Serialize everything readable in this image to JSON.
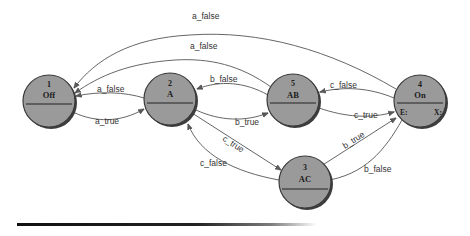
{
  "diagram": {
    "type": "state-machine",
    "nodes": [
      {
        "id": "1",
        "name": "Off",
        "cx": 49,
        "cy": 101,
        "r": 26
      },
      {
        "id": "2",
        "name": "A",
        "cx": 170,
        "cy": 99,
        "r": 26
      },
      {
        "id": "5",
        "name": "AB",
        "cx": 293,
        "cy": 100,
        "r": 26
      },
      {
        "id": "4",
        "name": "On",
        "cx": 420,
        "cy": 101,
        "r": 26,
        "entry": "E:",
        "exit": "X:"
      },
      {
        "id": "3",
        "name": "AC",
        "cx": 305,
        "cy": 182,
        "r": 26
      }
    ],
    "edges": [
      {
        "from": "On",
        "to": "Off",
        "label": "a_false"
      },
      {
        "from": "AB",
        "to": "Off",
        "label": "a_false"
      },
      {
        "from": "A",
        "to": "Off",
        "label": "a_false"
      },
      {
        "from": "Off",
        "to": "A",
        "label": "a_true"
      },
      {
        "from": "AB",
        "to": "A",
        "label": "b_false"
      },
      {
        "from": "A",
        "to": "AB",
        "label": "b_true"
      },
      {
        "from": "On",
        "to": "AB",
        "label": "c_false"
      },
      {
        "from": "AB",
        "to": "On",
        "label": "c_true"
      },
      {
        "from": "A",
        "to": "AC",
        "label": "c_true"
      },
      {
        "from": "AC",
        "to": "A",
        "label": "c_false"
      },
      {
        "from": "AC",
        "to": "On",
        "label": "b_true"
      },
      {
        "from": "On",
        "to": "AC",
        "label": "b_false"
      }
    ]
  },
  "labels": {
    "on_off_a_false": "a_false",
    "ab_off_a_false": "a_false",
    "a_off_a_false": "a_false",
    "off_a_a_true": "a_true",
    "ab_a_b_false": "b_false",
    "a_ab_b_true": "b_true",
    "on_ab_c_false": "c_false",
    "ab_on_c_true": "c_true",
    "a_ac_c_true": "c_true",
    "ac_a_c_false": "c_false",
    "ac_on_b_true": "b_true",
    "on_ac_b_false": "b_false"
  },
  "nodes": {
    "off": {
      "id": "1",
      "name": "Off"
    },
    "a": {
      "id": "2",
      "name": "A"
    },
    "ab": {
      "id": "5",
      "name": "AB"
    },
    "on": {
      "id": "4",
      "name": "On",
      "entry": "E:",
      "exit": "X:"
    },
    "ac": {
      "id": "3",
      "name": "AC"
    }
  },
  "colors": {
    "node_fill": "#9a9a9a",
    "node_stroke": "#3a3a3a",
    "edge": "#555555",
    "background": "#ffffff"
  }
}
